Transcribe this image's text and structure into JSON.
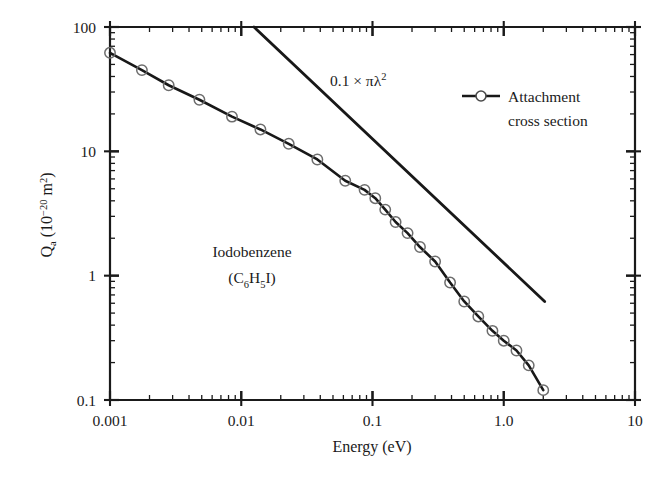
{
  "chart_data": {
    "type": "line",
    "title": "",
    "xlabel": "Energy (eV)",
    "ylabel_main": "Q",
    "ylabel_sub": "a",
    "ylabel_unit_open": " (10",
    "ylabel_unit_exp": "−20",
    "ylabel_unit_close": " m",
    "ylabel_unit_exp2": "2",
    "ylabel_unit_end": ")",
    "xscale": "log",
    "yscale": "log",
    "xlim": [
      0.001,
      10
    ],
    "ylim": [
      0.1,
      100
    ],
    "grid": false,
    "xticklabels": [
      "0.001",
      "0.01",
      "0.1",
      "1.0",
      "10"
    ],
    "xtickvalues": [
      0.001,
      0.01,
      0.1,
      1.0,
      10
    ],
    "yticklabels": [
      "0.1",
      "1",
      "10",
      "100"
    ],
    "ytickvalues": [
      0.1,
      1,
      10,
      100
    ],
    "series": [
      {
        "name": "Attachment cross section",
        "marker": "open-circle",
        "x": [
          0.001,
          0.00175,
          0.0028,
          0.0048,
          0.0085,
          0.014,
          0.023,
          0.038,
          0.062,
          0.087,
          0.105,
          0.125,
          0.15,
          0.185,
          0.23,
          0.3,
          0.39,
          0.5,
          0.64,
          0.82,
          1.0,
          1.25,
          1.55,
          2.0
        ],
        "y": [
          62.0,
          45.0,
          34.0,
          26.0,
          19.0,
          15.0,
          11.5,
          8.6,
          5.8,
          4.9,
          4.2,
          3.4,
          2.7,
          2.2,
          1.7,
          1.3,
          0.88,
          0.62,
          0.47,
          0.36,
          0.3,
          0.25,
          0.19,
          0.12
        ]
      }
    ],
    "annotations": [
      {
        "name": "reference-line-label",
        "text_prefix": "0.1 × πλ",
        "text_sup": "2",
        "x_px": 330,
        "y_px": 80
      },
      {
        "name": "molecule-label",
        "line1": "Iodobenzene",
        "line2_open": "(C",
        "line2_sub1": "6",
        "line2_mid": "H",
        "line2_sub2": "5",
        "line2_close": "I)"
      }
    ],
    "reference_line": {
      "name": "0.1 x pi lambda squared",
      "slope_loglog": -1,
      "x_start": 0.0125,
      "y_start": 100,
      "x_end": 2.05,
      "y_end": 0.62
    },
    "legend": {
      "position": "upper-right-inside",
      "entries": [
        {
          "label_line1": "Attachment",
          "label_line2": "cross section",
          "marker": "line-open-circle"
        }
      ]
    },
    "colors": {
      "axis": "#1a1a1a",
      "curve": "#181818",
      "marker_edge": "#6d6d6d",
      "reference_line": "#181818",
      "background": "#ffffff"
    }
  }
}
